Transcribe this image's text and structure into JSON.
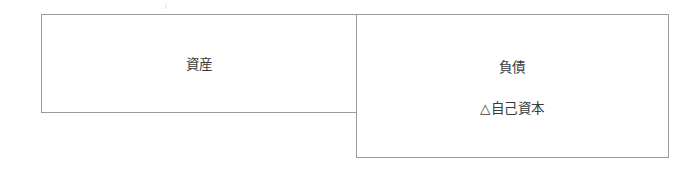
{
  "diagram": {
    "type": "balance-sheet-box-diagram",
    "title": "",
    "background_color": "#ffffff",
    "border_color": "#9b9b9b",
    "text_color": "#3a3a3a",
    "blocks": [
      {
        "id": "assets",
        "label": "資産",
        "side": "left",
        "x": 41,
        "y": 14,
        "width": 316,
        "height": 99
      },
      {
        "id": "liabilities-equity",
        "side": "right",
        "x": 356,
        "y": 14,
        "width": 313,
        "height": 144,
        "lines": [
          {
            "id": "liabilities",
            "label": "負債"
          },
          {
            "id": "equity-negative",
            "label": "△自己資本"
          }
        ]
      }
    ]
  }
}
